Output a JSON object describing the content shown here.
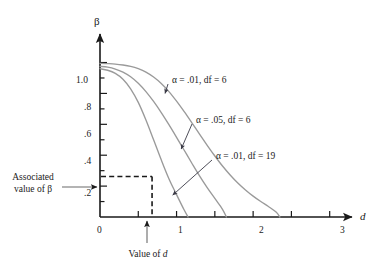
{
  "chart_data": {
    "type": "line",
    "title": "",
    "subtitle": "",
    "xlabel": "d",
    "ylabel": "β",
    "xlim": [
      0,
      3.2
    ],
    "ylim": [
      0,
      1.12
    ],
    "grid": false,
    "legend_position": "inline-annotations",
    "x_ticks": [
      0,
      0.5,
      1,
      1.5,
      2,
      2.5,
      3
    ],
    "x_tick_labels": [
      "0",
      "",
      "1",
      "",
      "2",
      "",
      "3"
    ],
    "y_ticks": [
      0,
      0.1,
      0.2,
      0.3,
      0.4,
      0.5,
      0.6,
      0.7,
      0.8,
      0.9,
      1.0
    ],
    "y_tick_labels": [
      "",
      "",
      ".2",
      "",
      ".4",
      "",
      ".6",
      "",
      ".8",
      "",
      "1.0"
    ],
    "series": [
      {
        "name": "α = .01, df = 6",
        "color": "#9a9a9a",
        "x": [
          0.0,
          0.1,
          0.2,
          0.3,
          0.4,
          0.5,
          0.6,
          0.7,
          0.8,
          0.9,
          1.0,
          1.1,
          1.2,
          1.3,
          1.4,
          1.5,
          1.6,
          1.7,
          1.8,
          1.9,
          2.0,
          2.1,
          2.2,
          2.3,
          2.35
        ],
        "y": [
          0.995,
          0.993,
          0.99,
          0.984,
          0.975,
          0.96,
          0.938,
          0.906,
          0.864,
          0.812,
          0.75,
          0.682,
          0.61,
          0.536,
          0.464,
          0.395,
          0.33,
          0.272,
          0.22,
          0.175,
          0.135,
          0.1,
          0.068,
          0.032,
          0.0
        ]
      },
      {
        "name": "α = .05, df = 6",
        "color": "#9a9a9a",
        "x": [
          0.0,
          0.1,
          0.2,
          0.3,
          0.4,
          0.5,
          0.6,
          0.7,
          0.8,
          0.9,
          1.0,
          1.1,
          1.2,
          1.3,
          1.4,
          1.5,
          1.6,
          1.65
        ],
        "y": [
          0.975,
          0.97,
          0.958,
          0.938,
          0.908,
          0.866,
          0.812,
          0.748,
          0.676,
          0.598,
          0.516,
          0.432,
          0.348,
          0.266,
          0.19,
          0.12,
          0.05,
          0.0
        ]
      },
      {
        "name": "α = .01, df = 19",
        "color": "#9a9a9a",
        "x": [
          0.0,
          0.1,
          0.2,
          0.3,
          0.4,
          0.5,
          0.6,
          0.7,
          0.8,
          0.9,
          1.0,
          1.1,
          1.15
        ],
        "y": [
          0.96,
          0.95,
          0.93,
          0.892,
          0.83,
          0.742,
          0.628,
          0.5,
          0.37,
          0.248,
          0.145,
          0.045,
          0.0
        ]
      }
    ],
    "annotations": [
      {
        "text": "α = .01, df = 6",
        "label_x": 2.18,
        "label_y": 0.885,
        "arrow_to_x": 0.85,
        "arrow_to_y": 0.8
      },
      {
        "text": "α = .05, df = 6",
        "label_x": 2.48,
        "label_y": 0.65,
        "arrow_to_x": 1.06,
        "arrow_to_y": 0.44
      },
      {
        "text": "α = .01, df = 19",
        "label_x": 2.78,
        "label_y": 0.43,
        "arrow_to_x": 0.95,
        "arrow_to_y": 0.142
      }
    ],
    "reference_lines": {
      "d_value": 0.68,
      "beta_value": 0.262,
      "style": "dashed"
    },
    "callouts": [
      {
        "text_line1": "Associated",
        "text_line2": "value of β",
        "points_to": "beta-axis"
      },
      {
        "text_line1": "Value of d",
        "text_line2": "",
        "points_to": "d-axis"
      }
    ]
  },
  "labels": {
    "y_axis_symbol": "β",
    "x_axis_symbol": "d",
    "associated_line1": "Associated",
    "associated_line2": "value of β",
    "value_of_d": "Value of ",
    "value_of_d_italic": "d",
    "tick_0": "0",
    "tick_1": "1",
    "tick_2": "2",
    "tick_3": "3",
    "tick_1p0": "1.0",
    "tick_p8": ".8",
    "tick_p6": ".6",
    "tick_p4": ".4",
    "tick_p2": ".2",
    "annot_1": "α = .01, df = 6",
    "annot_2": "α = .05, df = 6",
    "annot_3": "α = .01, df = 19"
  },
  "colors": {
    "curve": "#9a9a9a",
    "axis": "#1a1a1a",
    "text": "#1a1a1a",
    "background": "#ffffff"
  }
}
